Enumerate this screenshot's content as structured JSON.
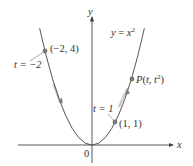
{
  "figure": {
    "curve_label": "y = x²",
    "axes": {
      "x_label": "x",
      "y_label": "y",
      "origin_label": "0"
    },
    "points": [
      {
        "name": "point-neg2-4",
        "coord_label": "(−2, 4)",
        "param_label": "t = −2",
        "x": -2,
        "y": 4
      },
      {
        "name": "point-1-1",
        "coord_label": "(1, 1)",
        "param_label": "t = 1",
        "x": 1,
        "y": 1
      },
      {
        "name": "point-P",
        "coord_label": "P(t, t²)",
        "x": 1.7,
        "y": 2.89
      }
    ],
    "colors": {
      "curve": "#555555",
      "axis": "#444444",
      "point": "#777777",
      "arrow": "#b0b0b0",
      "text": "#333333"
    }
  },
  "labels": {
    "curve_eq_y": "y",
    "curve_eq_eq": " = ",
    "curve_eq_x": "x",
    "curve_eq_exp": "2",
    "pt_a_coord": "(−2, 4)",
    "pt_a_param": "t = −2",
    "pt_b_coord": "(1, 1)",
    "pt_b_param": "t = 1",
    "pt_p_P": "P",
    "pt_p_rest1": "(",
    "pt_p_t1": "t",
    "pt_p_comma": ", ",
    "pt_p_t2": "t",
    "pt_p_exp": "2",
    "pt_p_close": ")",
    "x_axis": "x",
    "y_axis": "y",
    "origin": "0"
  }
}
